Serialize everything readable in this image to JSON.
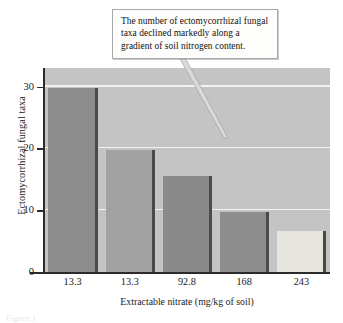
{
  "callout": {
    "text": "The number of ectomycorrhizal fungal taxa declined markedly along a gradient of soil nitrogen content."
  },
  "caption_partial": "Figure 1",
  "chart_data": {
    "type": "bar",
    "title": "",
    "categories": [
      "13.3",
      "13.3",
      "92.8",
      "168",
      "243"
    ],
    "values": [
      29.8,
      19.7,
      15.6,
      9.7,
      6.7
    ],
    "xlabel": "Extractable nitrate (mg/kg of soil)",
    "ylabel": "Ectomycorrhizal fungal taxa",
    "ylim": [
      0,
      33
    ],
    "yticks": [
      0,
      10,
      20,
      30
    ],
    "ytick_labels": [
      "0",
      "10",
      "20",
      "30"
    ],
    "grid": true,
    "gridline_values": [
      10,
      20,
      30
    ],
    "legend": "none",
    "bar_colors": [
      "#8d8d8d",
      "#a2a2a2",
      "#8a8a8a",
      "#8d8d8d",
      "#e6e6df"
    ],
    "plot_background": "#c4c4c4",
    "gridline_color": "#f2f2f2",
    "axis_color": "#2b2b2b"
  }
}
